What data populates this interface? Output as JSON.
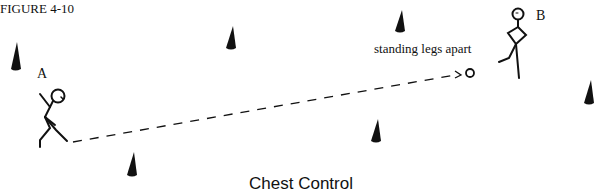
{
  "figure": {
    "label": "FIGURE 4-10",
    "caption": "Chest Control"
  },
  "players": [
    {
      "id": "A",
      "label": "A"
    },
    {
      "id": "B",
      "label": "B"
    }
  ],
  "annotation": "standing legs apart",
  "colors": {
    "ink": "#111111",
    "background": "#ffffff"
  },
  "cones": [
    {
      "x": 15,
      "y": 58
    },
    {
      "x": 231,
      "y": 32
    },
    {
      "x": 400,
      "y": 21
    },
    {
      "x": 589,
      "y": 91
    },
    {
      "x": 377,
      "y": 128
    },
    {
      "x": 131,
      "y": 163
    }
  ]
}
